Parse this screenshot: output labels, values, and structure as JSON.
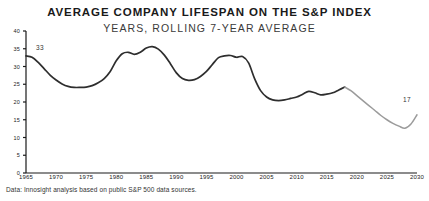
{
  "chart_data": {
    "type": "line",
    "title": "AVERAGE COMPANY LIFESPAN ON THE S&P INDEX",
    "subtitle": "YEARS, ROLLING 7-YEAR AVERAGE",
    "xlabel": "",
    "ylabel": "",
    "xlim": [
      1965,
      2030
    ],
    "ylim": [
      0,
      40
    ],
    "grid": false,
    "legend_position": "none",
    "source_note": "Data: Innosight analysis based on public S&P 500 data sources.",
    "xticks": [
      "1965",
      "1970",
      "1975",
      "1980",
      "1985",
      "1990",
      "1995",
      "2000",
      "2005",
      "2010",
      "2015",
      "2020",
      "2025",
      "2030"
    ],
    "yticks": [
      "0",
      "5",
      "10",
      "15",
      "20",
      "25",
      "30",
      "35",
      "40"
    ],
    "annotations": [
      {
        "label": "33",
        "x": 1966,
        "y": 33
      },
      {
        "label": "17",
        "x": 2030,
        "y": 17
      }
    ],
    "colors": {
      "historical_line": "#2e2e2e",
      "projected_line": "#9b9b9b",
      "axis": "#1a1a1a",
      "text": "#222222"
    },
    "series": [
      {
        "name": "Historical",
        "style": "solid",
        "color": "#2e2e2e",
        "x": [
          1965,
          1966,
          1967,
          1968,
          1969,
          1970,
          1971,
          1972,
          1973,
          1974,
          1975,
          1976,
          1977,
          1978,
          1979,
          1980,
          1981,
          1982,
          1983,
          1984,
          1985,
          1986,
          1987,
          1988,
          1989,
          1990,
          1991,
          1992,
          1993,
          1994,
          1995,
          1996,
          1997,
          1998,
          1999,
          2000,
          2001,
          2002,
          2003,
          2004,
          2005,
          2006,
          2007,
          2008,
          2009,
          2010,
          2011,
          2012,
          2013,
          2014,
          2015,
          2016,
          2017,
          2018
        ],
        "y": [
          33,
          32.6,
          31.2,
          29.4,
          27.6,
          26.2,
          25.1,
          24.4,
          24.1,
          24.1,
          24.2,
          24.6,
          25.4,
          26.6,
          28.6,
          31.6,
          33.6,
          34,
          33.4,
          34,
          35.2,
          35.6,
          34.9,
          33.2,
          30.8,
          28.2,
          26.6,
          26.1,
          26.3,
          27.2,
          28.6,
          30.6,
          32.5,
          33,
          33.1,
          32.6,
          32.8,
          31,
          26.6,
          23.2,
          21.4,
          20.6,
          20.4,
          20.6,
          21,
          21.4,
          22.2,
          23,
          22.6,
          22,
          22.2,
          22.6,
          23.4,
          24.2
        ]
      },
      {
        "name": "Projected",
        "style": "solid",
        "color": "#9b9b9b",
        "x": [
          2018,
          2019,
          2020,
          2021,
          2022,
          2023,
          2024,
          2025,
          2026,
          2027,
          2028,
          2029,
          2030
        ],
        "y": [
          24.2,
          23.2,
          21.8,
          20.4,
          19,
          17.6,
          16.2,
          15,
          14,
          13.2,
          12.6,
          13.8,
          16.4
        ]
      }
    ]
  }
}
